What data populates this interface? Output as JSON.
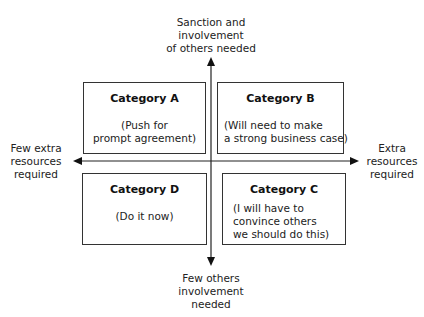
{
  "axes": {
    "top_label": [
      "Sanction and",
      "involvement",
      "of others needed"
    ],
    "bottom_label": [
      "Few others",
      "involvement",
      "needed"
    ],
    "left_label": [
      "Few extra",
      "resources",
      "required"
    ],
    "right_label": [
      "Extra",
      "resources",
      "required"
    ]
  },
  "quadrants": {
    "a": {
      "title": "Category A",
      "desc": [
        "(Push for",
        "prompt agreement)"
      ]
    },
    "b": {
      "title": "Category B",
      "desc": [
        "(Will need to make",
        "a strong business case)"
      ]
    },
    "c": {
      "title": "Category C",
      "desc": [
        "(I will have to",
        "convince others",
        "we should do this)"
      ]
    },
    "d": {
      "title": "Category D",
      "desc": [
        "(Do it now)"
      ]
    }
  },
  "colors": {
    "line": "#222222",
    "background": "#ffffff"
  }
}
